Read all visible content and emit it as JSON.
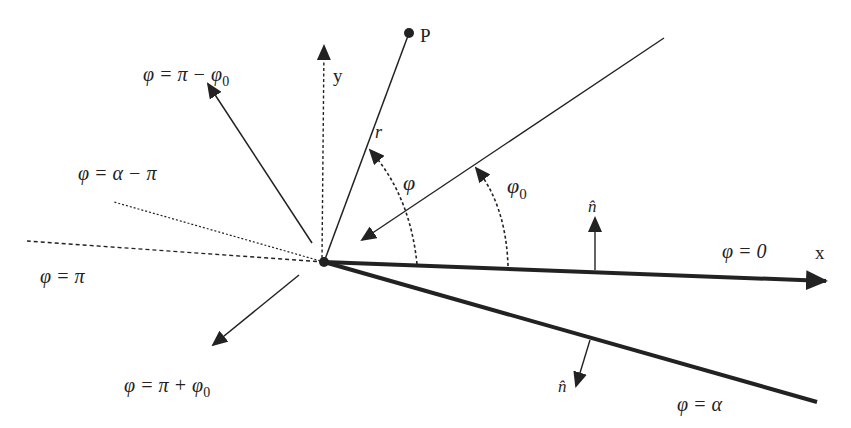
{
  "diagram": {
    "type": "wedge-geometry",
    "colors": {
      "stroke": "#222222",
      "background": "#ffffff"
    },
    "axes": {
      "x_label": "x",
      "y_label": "y"
    },
    "point": {
      "label": "P"
    },
    "radius_label": "r",
    "angle_labels": {
      "phi": "φ",
      "phi0": "φ",
      "phi0_sub": "0"
    },
    "normal_label": "n̂",
    "lines": [
      {
        "id": "phi-zero",
        "label": "φ = 0"
      },
      {
        "id": "phi-alpha",
        "label": "φ = α"
      },
      {
        "id": "phi-pi",
        "label": "φ = π"
      },
      {
        "id": "phi-alpha-minus-pi",
        "label": "φ = α − π"
      },
      {
        "id": "phi-pi-minus-phi0",
        "label": "φ = π − φ",
        "sub": "0"
      },
      {
        "id": "phi-pi-plus-phi0",
        "label": "φ = π + φ",
        "sub": "0"
      }
    ]
  }
}
